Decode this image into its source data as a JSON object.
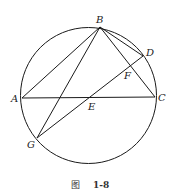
{
  "figure": {
    "caption_prefix": "图",
    "caption_number": "1-8"
  },
  "circle": {
    "cx": 88.5,
    "cy": 95.5,
    "r": 68,
    "stroke": "#1a1a1a"
  },
  "points": {
    "A": {
      "label": "A",
      "x": 22,
      "y": 98
    },
    "B": {
      "label": "B",
      "x": 100,
      "y": 27
    },
    "C": {
      "label": "C",
      "x": 155,
      "y": 97
    },
    "D": {
      "label": "D",
      "x": 143,
      "y": 56
    },
    "E": {
      "label": "E",
      "x": 89,
      "y": 98
    },
    "F": {
      "label": "F",
      "x": 130,
      "y": 67
    },
    "G": {
      "label": "G",
      "x": 37,
      "y": 138
    }
  },
  "segments": [
    [
      "B",
      "A"
    ],
    [
      "B",
      "G"
    ],
    [
      "B",
      "C"
    ],
    [
      "B",
      "D"
    ],
    [
      "A",
      "C"
    ],
    [
      "G",
      "D"
    ]
  ]
}
